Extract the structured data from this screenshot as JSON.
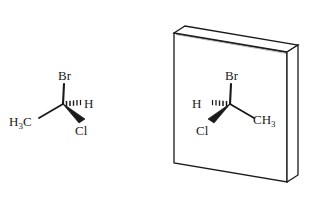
{
  "figure": {
    "background_color": "#ffffff",
    "stroke_color": "#1a1a1a",
    "width": 315,
    "height": 198
  },
  "molecules": [
    {
      "id": "left-enantiomer",
      "name": "1-bromo-1-chloroethane (left enantiomer)",
      "center": {
        "x": 63,
        "y": 104
      },
      "labels": {
        "top": "Br",
        "top_sub": "",
        "left": "H",
        "left_sub": "3",
        "left_tail": "C",
        "right": "H",
        "bottom": "Cl"
      },
      "bonds": [
        {
          "name": "bond-to-br",
          "type": "plain",
          "to": "Br"
        },
        {
          "name": "bond-to-methyl",
          "type": "plain",
          "to": "H3C"
        },
        {
          "name": "bond-to-hydrogen",
          "type": "hashed-wedge",
          "to": "H"
        },
        {
          "name": "bond-to-chlorine",
          "type": "bold-wedge",
          "to": "Cl"
        }
      ]
    },
    {
      "id": "right-enantiomer",
      "name": "1-bromo-1-chloroethane (mirror image)",
      "center": {
        "x": 230,
        "y": 104
      },
      "labels": {
        "top": "Br",
        "left": "H",
        "right": "CH",
        "right_sub": "3",
        "bottom": "Cl"
      },
      "bonds": [
        {
          "name": "bond-to-br",
          "type": "plain",
          "to": "Br"
        },
        {
          "name": "bond-to-methyl",
          "type": "plain",
          "to": "CH3"
        },
        {
          "name": "bond-to-hydrogen",
          "type": "hashed-wedge",
          "to": "H"
        },
        {
          "name": "bond-to-chlorine",
          "type": "bold-wedge",
          "to": "Cl"
        }
      ]
    }
  ],
  "mirror": {
    "name": "mirror-plate",
    "description": "three-dimensional mirror slab",
    "face_fill": "#ffffff",
    "edge_fill": "#ffffff",
    "stroke": "#1a1a1a",
    "front_face": "174,33 287,52 287,182 174,163",
    "top_face": "174,33 185,26 298,45 287,52",
    "side_face": "287,52 298,45 298,175 287,182"
  }
}
